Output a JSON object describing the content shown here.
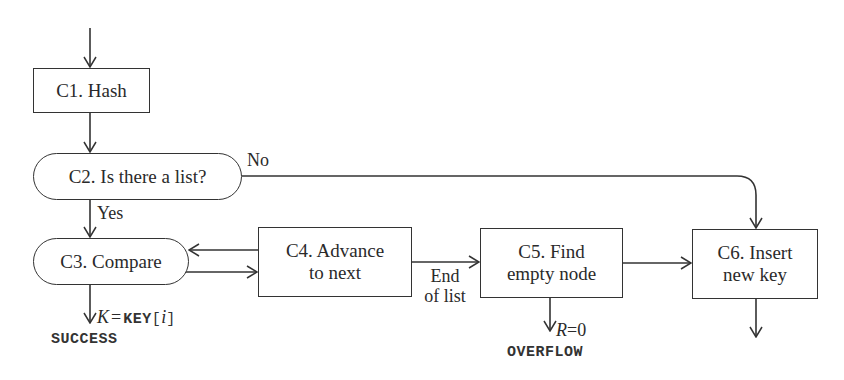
{
  "diagram": {
    "type": "flowchart",
    "nodes": [
      {
        "id": "C1",
        "label": "C1. Hash",
        "shape": "rectangle"
      },
      {
        "id": "C2",
        "label": "C2. Is there a list?",
        "shape": "rounded"
      },
      {
        "id": "C3",
        "label": "C3. Compare",
        "shape": "rounded"
      },
      {
        "id": "C4",
        "label": "C4. Advance\nto next",
        "shape": "rectangle"
      },
      {
        "id": "C5",
        "label": "C5. Find\nempty node",
        "shape": "rectangle"
      },
      {
        "id": "C6",
        "label": "C6. Insert\nnew key",
        "shape": "rectangle"
      }
    ],
    "edges": [
      {
        "from": "start",
        "to": "C1",
        "label": ""
      },
      {
        "from": "C1",
        "to": "C2",
        "label": ""
      },
      {
        "from": "C2",
        "to": "C3",
        "label": "Yes"
      },
      {
        "from": "C2",
        "to": "C6",
        "label": "No"
      },
      {
        "from": "C3",
        "to": "C4",
        "label": ""
      },
      {
        "from": "C4",
        "to": "C3",
        "label": ""
      },
      {
        "from": "C3",
        "to": "SUCCESS",
        "label": "K = KEY[i]"
      },
      {
        "from": "C4",
        "to": "C5",
        "label": "End of list"
      },
      {
        "from": "C5",
        "to": "OVERFLOW",
        "label": "R = 0"
      },
      {
        "from": "C5",
        "to": "C6",
        "label": ""
      },
      {
        "from": "C6",
        "to": "exit",
        "label": ""
      }
    ],
    "labels": {
      "yes": "Yes",
      "no": "No",
      "end_of_list": "End\nof list",
      "k_var": "K",
      "equals": "=",
      "key_array": "KEY",
      "bracket_open": "[",
      "index_var": "i",
      "bracket_close": "]",
      "r_var": "R",
      "r_equals": "=0"
    },
    "terminals": {
      "success": "SUCCESS",
      "overflow": "OVERFLOW"
    },
    "colors": {
      "stroke": "#333333",
      "text": "#2a2a2a",
      "background": "#ffffff"
    }
  }
}
